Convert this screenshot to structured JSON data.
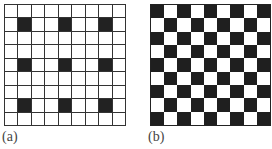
{
  "figures": [
    {
      "label": "(a)",
      "rows": 9,
      "cols": 9,
      "pattern": "sparse",
      "black_cells": [
        [
          1,
          1
        ],
        [
          1,
          4
        ],
        [
          1,
          7
        ],
        [
          4,
          1
        ],
        [
          4,
          4
        ],
        [
          4,
          7
        ],
        [
          7,
          1
        ],
        [
          7,
          4
        ],
        [
          7,
          7
        ]
      ]
    },
    {
      "label": "(b)",
      "rows": 9,
      "cols": 9,
      "pattern": "checkerboard",
      "top_left": "black"
    }
  ],
  "colors": {
    "black": "#222222",
    "white": "#ffffff",
    "gridline": "#333333"
  }
}
